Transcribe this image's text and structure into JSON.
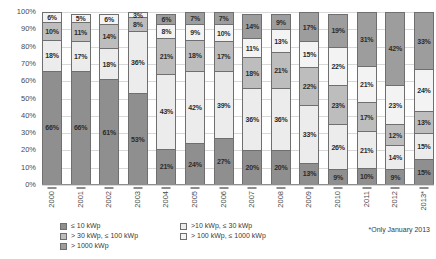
{
  "chart_data": {
    "type": "bar",
    "subtype": "stacked-percentage",
    "title": "",
    "xlabel": "",
    "ylabel": "",
    "ylim": [
      0,
      100
    ],
    "y_unit": "%",
    "grid": true,
    "legend_position": "bottom-left",
    "categories": [
      "2000",
      "2001",
      "2002",
      "2003",
      "2004",
      "2005",
      "2006",
      "2007",
      "2008",
      "2009",
      "2010",
      "2011",
      "2012",
      "2013*"
    ],
    "y_ticks": [
      "0%",
      "10%",
      "20%",
      "30%",
      "40%",
      "50%",
      "60%",
      "70%",
      "80%",
      "90%",
      "100%"
    ],
    "series": [
      {
        "name": "≤ 10 kWp",
        "color": "#8f8f8f",
        "values": [
          66,
          66,
          61,
          53,
          21,
          24,
          27,
          20,
          20,
          13,
          9,
          10,
          9,
          15
        ],
        "labels": [
          "66%",
          "66%",
          "61%",
          "53%",
          "21%",
          "24%",
          "27%",
          "20%",
          "20%",
          "13%",
          "9%",
          "10%",
          "9%",
          "15%"
        ]
      },
      {
        "name": ">10 kWp, ≤ 30 kWp",
        "color": "#ececec",
        "values": [
          18,
          17,
          18,
          36,
          43,
          42,
          39,
          36,
          36,
          33,
          26,
          21,
          14,
          15
        ],
        "labels": [
          "18%",
          "17%",
          "18%",
          "36%",
          "43%",
          "42%",
          "39%",
          "36%",
          "36%",
          "33%",
          "26%",
          "21%",
          "14%",
          "15%"
        ]
      },
      {
        "name": "> 30 kWp, ≤ 100 kWp",
        "color": "#bdbdbd",
        "values": [
          10,
          11,
          14,
          8,
          21,
          18,
          17,
          18,
          21,
          22,
          23,
          17,
          12,
          13
        ],
        "labels": [
          "10%",
          "11%",
          "14%",
          "8%",
          "21%",
          "18%",
          "17%",
          "18%",
          "21%",
          "22%",
          "23%",
          "17%",
          "12%",
          "13%"
        ]
      },
      {
        "name": "> 100 kWp, ≤ 1000 kWp",
        "color": "#f3f3f3",
        "values": [
          6,
          5,
          6,
          3,
          8,
          9,
          10,
          11,
          13,
          15,
          22,
          21,
          23,
          24
        ],
        "labels": [
          "6%",
          "5%",
          "6%",
          "3%",
          "8%",
          "9%",
          "10%",
          "11%",
          "13%",
          "15%",
          "22%",
          "21%",
          "23%",
          "24%"
        ]
      },
      {
        "name": "> 1000 kWp",
        "color": "#9d9d9d",
        "values": [
          0,
          0,
          0,
          0,
          6,
          7,
          7,
          14,
          9,
          17,
          19,
          31,
          42,
          33
        ],
        "labels": [
          "",
          "",
          "",
          "",
          "6%",
          "7%",
          "7%",
          "14%",
          "9%",
          "17%",
          "19%",
          "31%",
          "42%",
          "33%"
        ]
      }
    ]
  },
  "legend": {
    "items": [
      {
        "label": "≤ 10 kWp",
        "color": "#8f8f8f"
      },
      {
        "label": ">10 kWp, ≤ 30 kWp",
        "color": "#ececec"
      },
      {
        "label": "> 30 kWp, ≤ 100 kWp",
        "color": "#bdbdbd"
      },
      {
        "label": "> 100 kWp, ≤ 1000 kWp",
        "color": "#f3f3f3"
      },
      {
        "label": "> 1000 kWp",
        "color": "#9d9d9d"
      }
    ]
  },
  "footnote": {
    "text": "*Only January 2013"
  }
}
